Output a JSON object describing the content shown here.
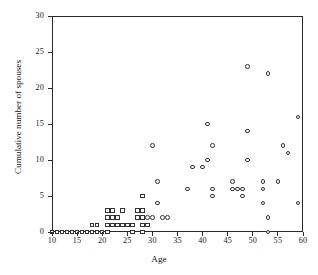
{
  "chart_data": {
    "type": "scatter",
    "title": "",
    "xlabel": "Age",
    "ylabel": "Cumulative number of spouses",
    "xlim": [
      10,
      60
    ],
    "ylim": [
      0,
      30
    ],
    "xticks": [
      10,
      15,
      20,
      25,
      30,
      35,
      40,
      45,
      50,
      55,
      60
    ],
    "yticks": [
      0,
      5,
      10,
      15,
      20,
      25,
      30
    ],
    "grid": false,
    "legend": "none",
    "series": [
      {
        "name": "squares",
        "marker": "open-square",
        "color": "#333333",
        "points": [
          [
            10,
            0
          ],
          [
            11,
            0
          ],
          [
            12,
            0
          ],
          [
            13,
            0
          ],
          [
            14,
            0
          ],
          [
            15,
            0
          ],
          [
            16,
            0
          ],
          [
            17,
            0
          ],
          [
            18,
            0
          ],
          [
            19,
            0
          ],
          [
            20,
            0
          ],
          [
            21,
            0
          ],
          [
            26,
            0
          ],
          [
            28,
            0
          ],
          [
            18,
            1
          ],
          [
            19,
            1
          ],
          [
            21,
            1
          ],
          [
            22,
            1
          ],
          [
            23,
            1
          ],
          [
            24,
            1
          ],
          [
            25,
            1
          ],
          [
            26,
            1
          ],
          [
            28,
            1
          ],
          [
            29,
            1
          ],
          [
            21,
            2
          ],
          [
            22,
            2
          ],
          [
            23,
            2
          ],
          [
            27,
            2
          ],
          [
            28,
            2
          ],
          [
            21,
            3
          ],
          [
            22,
            3
          ],
          [
            24,
            3
          ],
          [
            27,
            3
          ],
          [
            28,
            3
          ],
          [
            28,
            5
          ]
        ]
      },
      {
        "name": "circles",
        "marker": "open-circle",
        "color": "#333333",
        "points": [
          [
            29,
            2
          ],
          [
            30,
            2
          ],
          [
            32,
            2
          ],
          [
            33,
            2
          ],
          [
            31,
            4
          ],
          [
            31,
            7
          ],
          [
            30,
            12
          ],
          [
            37,
            6
          ],
          [
            38,
            9
          ],
          [
            40,
            9
          ],
          [
            41,
            10
          ],
          [
            41,
            15
          ],
          [
            42,
            6
          ],
          [
            42,
            5
          ],
          [
            42,
            12
          ],
          [
            46,
            6
          ],
          [
            46,
            7
          ],
          [
            47,
            6
          ],
          [
            48,
            6
          ],
          [
            48,
            5
          ],
          [
            49,
            10
          ],
          [
            49,
            14
          ],
          [
            49,
            23
          ],
          [
            52,
            4
          ],
          [
            52,
            6
          ],
          [
            52,
            7
          ],
          [
            53,
            0
          ],
          [
            53,
            2
          ],
          [
            53,
            22
          ],
          [
            55,
            7
          ],
          [
            56,
            12
          ],
          [
            57,
            11
          ],
          [
            59,
            4
          ],
          [
            59,
            16
          ]
        ]
      }
    ]
  },
  "axes": {
    "x_tick_labels": [
      "10",
      "15",
      "20",
      "25",
      "30",
      "35",
      "40",
      "45",
      "50",
      "55",
      "60"
    ],
    "y_tick_labels": [
      "0",
      "5",
      "10",
      "15",
      "20",
      "25",
      "30"
    ],
    "x_axis_title": "Age",
    "y_axis_title": "Cumulative number of spouses"
  }
}
